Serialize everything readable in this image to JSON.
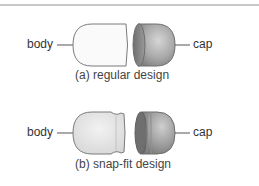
{
  "figure": {
    "panels": [
      {
        "id": "a",
        "caption": "(a) regular design",
        "labels": {
          "left": "body",
          "right": "cap"
        }
      },
      {
        "id": "b",
        "caption": "(b) snap-fit design",
        "labels": {
          "left": "body",
          "right": "cap"
        }
      }
    ]
  },
  "colors": {
    "outline": "#777777",
    "body_fill": "#fafafa",
    "body_fill_b": "#e6e6e6",
    "cap_fill_light": "#c8c8c8",
    "cap_fill_dark": "#7a7a7a",
    "leader_line": "#555555",
    "rule": "#c8c8c8"
  }
}
